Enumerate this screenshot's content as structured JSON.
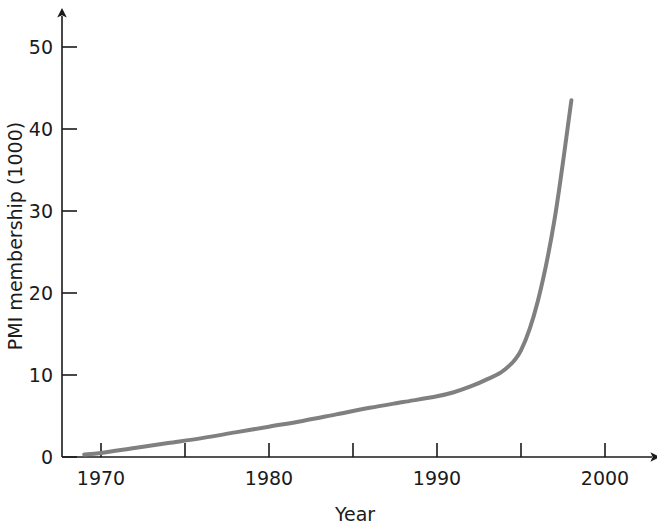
{
  "chart_data": {
    "type": "line",
    "title": "",
    "xlabel": "Year",
    "ylabel": "PMI membership (1000)",
    "xlim": [
      1968.5,
      2002.5
    ],
    "ylim": [
      0,
      54
    ],
    "grid": false,
    "legend": null,
    "x_ticks": [
      {
        "value": 1970,
        "label": "1970"
      },
      {
        "value": 1975,
        "label": ""
      },
      {
        "value": 1980,
        "label": "1980"
      },
      {
        "value": 1985,
        "label": ""
      },
      {
        "value": 1990,
        "label": "1990"
      },
      {
        "value": 1995,
        "label": ""
      },
      {
        "value": 2000,
        "label": "2000"
      }
    ],
    "y_ticks": [
      {
        "value": 0,
        "label": "0"
      },
      {
        "value": 10,
        "label": "10"
      },
      {
        "value": 20,
        "label": "20"
      },
      {
        "value": 30,
        "label": "30"
      },
      {
        "value": 40,
        "label": "40"
      },
      {
        "value": 50,
        "label": "50"
      }
    ],
    "series": [
      {
        "name": "PMI membership",
        "color": "#808080",
        "line_width": 4,
        "x": [
          1969,
          1970,
          1972,
          1974,
          1976,
          1978,
          1980,
          1982,
          1984,
          1986,
          1988,
          1990,
          1991,
          1992,
          1993,
          1994,
          1995,
          1996,
          1997,
          1998
        ],
        "values": [
          0.3,
          0.5,
          1.1,
          1.7,
          2.3,
          3.0,
          3.7,
          4.4,
          5.2,
          6.0,
          6.7,
          7.4,
          7.9,
          8.6,
          9.5,
          10.6,
          13.0,
          19.0,
          29.0,
          43.5
        ]
      }
    ],
    "axis_arrows": {
      "x": true,
      "y": true
    }
  },
  "geometry": {
    "origin_x": 62,
    "origin_y": 457,
    "x_per_year": 16.8,
    "y_per_unit": 8.2,
    "x_axis_end": 655,
    "y_axis_end": 14
  }
}
